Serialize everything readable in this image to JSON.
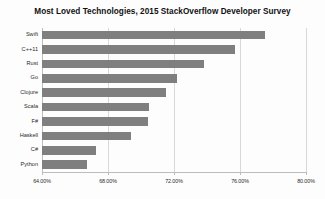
{
  "chart_data": {
    "type": "bar",
    "orientation": "horizontal",
    "title": "Most Loved Technologies, 2015 StackOverflow Developer Survey",
    "xlabel": "",
    "ylabel": "",
    "categories": [
      "Swift",
      "C++11",
      "Rust",
      "Go",
      "Clojure",
      "Scala",
      "F#",
      "Haskell",
      "C#",
      "Python"
    ],
    "values": [
      77.5,
      75.7,
      73.8,
      72.2,
      71.5,
      70.5,
      70.4,
      69.4,
      67.3,
      66.7
    ],
    "value_suffix": "%",
    "xlim": [
      64,
      80
    ],
    "xticks": [
      64,
      68,
      72,
      76,
      80
    ],
    "xtick_labels": [
      "64.00%",
      "68.00%",
      "72.00%",
      "76.00%",
      "80.00%"
    ],
    "grid": true,
    "grid_axis": "x",
    "legend": false,
    "bar_color": "#7f7f7f",
    "background_color": "#fdfdfd",
    "gridline_color": "#d8d8d8",
    "axis_color": "#bdbdbd",
    "text_color": "#2b2b2b"
  }
}
